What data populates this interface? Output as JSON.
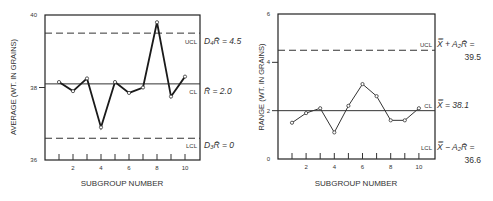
{
  "chart_data": [
    {
      "type": "line",
      "id": "average-chart",
      "title": "",
      "xlabel": "SUBGROUP NUMBER",
      "ylabel": "AVERAGE  (WT. IN GRAINS)",
      "x": [
        1,
        2,
        3,
        4,
        5,
        6,
        7,
        8,
        9,
        10
      ],
      "values": [
        38.15,
        37.9,
        38.25,
        36.9,
        38.15,
        37.85,
        38.0,
        39.8,
        37.75,
        38.3
      ],
      "ylim": [
        36,
        40
      ],
      "yticks": [
        "36",
        "38",
        "40"
      ],
      "xticks": [
        "2",
        "4",
        "6",
        "8",
        "10"
      ],
      "control_lines": {
        "ucl": {
          "label": "UCL",
          "value": 39.5,
          "style": "dashed",
          "annotation": "D₄R̄ = 4.5"
        },
        "cl": {
          "label": "CL",
          "value": 38.1,
          "style": "solid",
          "annotation": "R̄ = 2.0"
        },
        "lcl": {
          "label": "LCL",
          "value": 36.6,
          "style": "dashed",
          "annotation": "D₃R̄ = 0"
        }
      },
      "grid": false,
      "legend": "none"
    },
    {
      "type": "line",
      "id": "range-chart",
      "title": "",
      "xlabel": "SUBGROUP NUMBER",
      "ylabel": "RANGE  (WT. IN GRAINS)",
      "x": [
        1,
        2,
        3,
        4,
        5,
        6,
        7,
        8,
        9,
        10
      ],
      "values": [
        1.5,
        1.9,
        2.1,
        1.1,
        2.2,
        3.1,
        2.6,
        1.6,
        1.6,
        2.1
      ],
      "ylim": [
        0,
        6
      ],
      "yticks": [
        "0",
        "2",
        "4",
        "6"
      ],
      "xticks": [
        "2",
        "4",
        "6",
        "8",
        "10"
      ],
      "control_lines": {
        "ucl": {
          "label": "UCL",
          "value": 4.5,
          "style": "dashed",
          "annotation_line1": "X̿ + A₂R̄ =",
          "annotation_line2": "39.5"
        },
        "cl": {
          "label": "CL",
          "value": 2.0,
          "style": "solid",
          "annotation": "X̿ = 38.1"
        },
        "lcl": {
          "label": "LCL",
          "value": 0,
          "style": "none",
          "annotation_line1": "X̿ − A₂R̄ =",
          "annotation_line2": "36.6"
        }
      },
      "grid": false,
      "legend": "none"
    }
  ],
  "colors": {
    "line": "#1a1a1a",
    "frame": "#222222",
    "text": "#333333",
    "background": "#ffffff"
  }
}
